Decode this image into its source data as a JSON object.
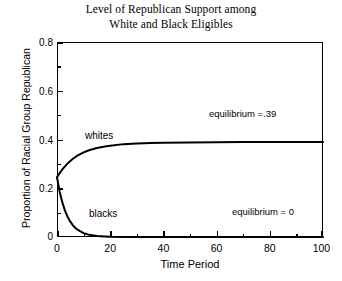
{
  "chart_data": {
    "type": "line",
    "title": "Level of Republican Support among White and Black Eligibles",
    "title_lines": [
      "Level of Republican Support among",
      "White and Black Eligibles"
    ],
    "xlabel": "Time Period",
    "ylabel": "Proportion of Racial Group Republican",
    "xlim": [
      0,
      100
    ],
    "ylim": [
      0,
      0.8
    ],
    "grid": false,
    "legend": "inline-labels",
    "x_ticks": [
      "0",
      "20",
      "40",
      "60",
      "80",
      "100"
    ],
    "x_tick_values": [
      0,
      20,
      40,
      60,
      80,
      100
    ],
    "x_minor_tick_values": [
      10,
      30,
      50,
      70,
      90
    ],
    "y_ticks": [
      "0",
      "0.2",
      "0.4",
      "0.6",
      "0.8"
    ],
    "y_tick_values": [
      0,
      0.2,
      0.4,
      0.6,
      0.8
    ],
    "y_minor_tick_values": [
      0.1,
      0.3,
      0.5,
      0.7
    ],
    "x": [
      0,
      1,
      2,
      3,
      4,
      5,
      6,
      7,
      8,
      10,
      12,
      15,
      18,
      20,
      25,
      30,
      35,
      40,
      50,
      60,
      70,
      80,
      90,
      100
    ],
    "series": [
      {
        "name": "whites",
        "label": "whites",
        "equilibrium": 0.39,
        "equilibrium_label": "equilibrium =.39",
        "start_value": 0.245,
        "color": "#000000",
        "values": [
          0.245,
          0.262,
          0.277,
          0.29,
          0.302,
          0.312,
          0.321,
          0.329,
          0.336,
          0.347,
          0.356,
          0.365,
          0.371,
          0.374,
          0.381,
          0.384,
          0.386,
          0.387,
          0.388,
          0.389,
          0.39,
          0.39,
          0.39,
          0.39
        ]
      },
      {
        "name": "blacks",
        "label": "blacks",
        "equilibrium": 0,
        "equilibrium_label": "equilibrium = 0",
        "start_value": 0.245,
        "color": "#000000",
        "values": [
          0.245,
          0.186,
          0.142,
          0.108,
          0.082,
          0.063,
          0.048,
          0.036,
          0.028,
          0.016,
          0.009,
          0.004,
          0.002,
          0.001,
          0.0,
          0.0,
          0.0,
          0.0,
          0.0,
          0.0,
          0.0,
          0.0,
          0.0,
          0.0
        ]
      }
    ],
    "annotations": [
      {
        "name": "whites-curve-label",
        "text": "whites"
      },
      {
        "name": "blacks-curve-label",
        "text": "blacks"
      },
      {
        "name": "white-equilibrium-note",
        "text": "equilibrium =.39"
      },
      {
        "name": "black-equilibrium-note",
        "text": "equilibrium = 0"
      }
    ]
  }
}
